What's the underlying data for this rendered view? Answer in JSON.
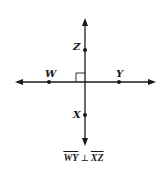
{
  "diagram": {
    "type": "perpendicular-lines",
    "points": {
      "Z": {
        "label": "Z",
        "x": 85,
        "y": 50
      },
      "X": {
        "label": "X",
        "x": 85,
        "y": 115
      },
      "W": {
        "label": "W",
        "x": 49,
        "y": 82
      },
      "Y": {
        "label": "Y",
        "x": 119,
        "y": 82
      }
    },
    "intersection": {
      "x": 85,
      "y": 82
    },
    "right_angle_marker": true,
    "caption": {
      "segment1": "WY",
      "symbol": "⊥",
      "segment2": "XZ"
    },
    "colors": {
      "line": "#1a1a1a",
      "background": "#ffffff"
    }
  }
}
